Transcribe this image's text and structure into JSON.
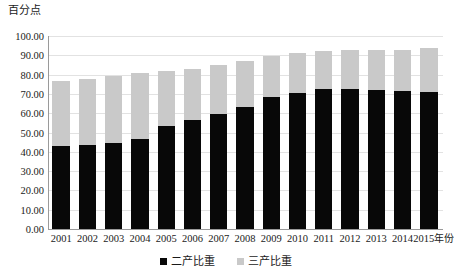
{
  "chart_data": {
    "type": "bar",
    "stacked": true,
    "title": "",
    "ylabel": "百分点",
    "xlabel": "年份",
    "ylim": [
      0,
      100
    ],
    "ytick_step": 10,
    "ytick_labels": [
      "100.00",
      "90.00",
      "80.00",
      "70.00",
      "60.00",
      "50.00",
      "40.00",
      "30.00",
      "20.00",
      "10.00",
      "0.00"
    ],
    "ytick_values": [
      100,
      90,
      80,
      70,
      60,
      50,
      40,
      30,
      20,
      10,
      0
    ],
    "grid": true,
    "legend_position": "bottom",
    "categories": [
      "2001",
      "2002",
      "2003",
      "2004",
      "2005",
      "2006",
      "2007",
      "2008",
      "2009",
      "2010",
      "2011",
      "2012",
      "2013",
      "2014",
      "2015"
    ],
    "x_axis_unit_suffix": "年份",
    "series": [
      {
        "name": "二产比重",
        "color": "#080808",
        "values": [
          43.0,
          43.4,
          44.6,
          46.8,
          53.2,
          56.4,
          59.8,
          63.2,
          68.6,
          70.6,
          72.6,
          72.5,
          72.0,
          71.4,
          70.8
        ]
      },
      {
        "name": "三产比重",
        "color": "#c9c9c9",
        "values": [
          33.6,
          34.4,
          34.5,
          34.0,
          28.6,
          26.6,
          25.4,
          24.0,
          21.0,
          20.8,
          19.8,
          20.4,
          21.0,
          21.4,
          22.8
        ]
      }
    ],
    "totals": [
      76.6,
      77.8,
      79.1,
      80.8,
      81.8,
      83.0,
      85.2,
      87.2,
      89.6,
      91.4,
      92.4,
      92.9,
      93.0,
      92.8,
      93.6
    ]
  },
  "legend": {
    "items": [
      {
        "label": "二产比重"
      },
      {
        "label": "三产比重"
      }
    ]
  }
}
